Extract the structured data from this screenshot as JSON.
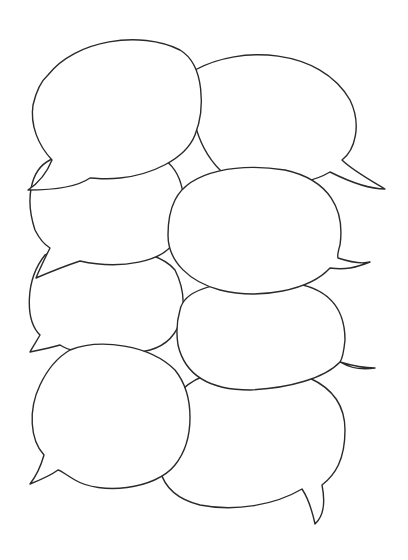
{
  "illustration": {
    "subject": "stacked empty speech bubbles",
    "background_color": "#ffffff",
    "stroke_color": "#2a2a2a",
    "bubble_count": 8,
    "bubbles": [
      {
        "id": "bottom-right",
        "tail": "bottom-right",
        "text": ""
      },
      {
        "id": "bottom-left",
        "tail": "bottom-left",
        "text": ""
      },
      {
        "id": "middle-right-lower",
        "tail": "right",
        "text": ""
      },
      {
        "id": "middle-left-lower",
        "tail": "bottom-left",
        "text": ""
      },
      {
        "id": "middle-left-upper",
        "tail": "left",
        "text": ""
      },
      {
        "id": "top-right",
        "tail": "bottom-right",
        "text": ""
      },
      {
        "id": "middle-right-upper",
        "tail": "right",
        "text": ""
      },
      {
        "id": "top-left",
        "tail": "bottom-left",
        "text": ""
      }
    ]
  }
}
